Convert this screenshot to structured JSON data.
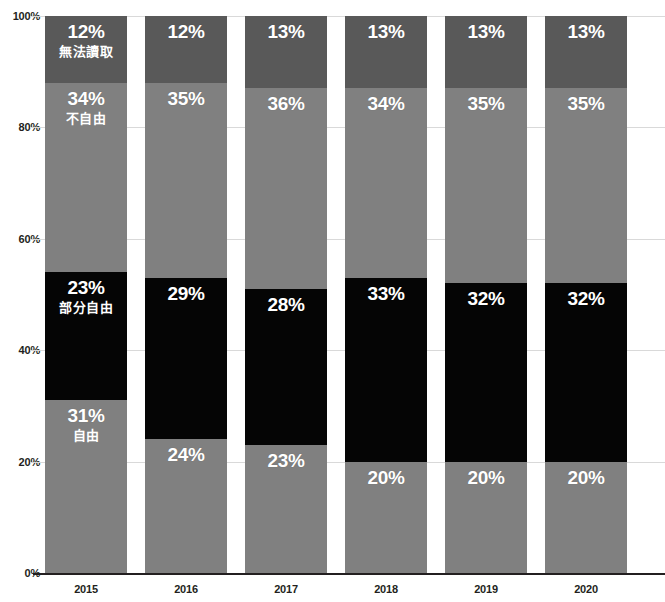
{
  "chart": {
    "title": "",
    "y_axis": {
      "ticks": [
        "0%",
        "20%",
        "40%",
        "60%",
        "80%",
        "100%"
      ],
      "min": 0,
      "max": 100
    },
    "x_axis": {
      "labels": [
        "2015",
        "2016",
        "2017",
        "2018",
        "2019",
        "2020"
      ]
    },
    "series_names": {
      "unrated": "無法讀取",
      "notfree": "不自由",
      "partly": "部分自由",
      "free": "自由"
    },
    "colors": {
      "unrated": "#595959",
      "notfree": "#808080",
      "partly": "#050505",
      "free": "#808080",
      "label_text": "#ffffff",
      "axis_text": "#231f20",
      "gridline": "#d9d9d9",
      "baseline": "#231f20",
      "background": "#ffffff"
    },
    "bars": [
      {
        "year": "2015",
        "unrated": {
          "value": 12,
          "label": "12%",
          "name": "無法讀取",
          "show_name": true
        },
        "notfree": {
          "value": 34,
          "label": "34%",
          "name": "不自由",
          "show_name": true
        },
        "partly": {
          "value": 23,
          "label": "23%",
          "name": "部分自由",
          "show_name": true
        },
        "free": {
          "value": 31,
          "label": "31%",
          "name": "自由",
          "show_name": true
        }
      },
      {
        "year": "2016",
        "unrated": {
          "value": 12,
          "label": "12%",
          "name": "",
          "show_name": false
        },
        "notfree": {
          "value": 35,
          "label": "35%",
          "name": "",
          "show_name": false
        },
        "partly": {
          "value": 29,
          "label": "29%",
          "name": "",
          "show_name": false
        },
        "free": {
          "value": 24,
          "label": "24%",
          "name": "",
          "show_name": false
        }
      },
      {
        "year": "2017",
        "unrated": {
          "value": 13,
          "label": "13%",
          "name": "",
          "show_name": false
        },
        "notfree": {
          "value": 36,
          "label": "36%",
          "name": "",
          "show_name": false
        },
        "partly": {
          "value": 28,
          "label": "28%",
          "name": "",
          "show_name": false
        },
        "free": {
          "value": 23,
          "label": "23%",
          "name": "",
          "show_name": false
        }
      },
      {
        "year": "2018",
        "unrated": {
          "value": 13,
          "label": "13%",
          "name": "",
          "show_name": false
        },
        "notfree": {
          "value": 34,
          "label": "34%",
          "name": "",
          "show_name": false
        },
        "partly": {
          "value": 33,
          "label": "33%",
          "name": "",
          "show_name": false
        },
        "free": {
          "value": 20,
          "label": "20%",
          "name": "",
          "show_name": false
        }
      },
      {
        "year": "2019",
        "unrated": {
          "value": 13,
          "label": "13%",
          "name": "",
          "show_name": false
        },
        "notfree": {
          "value": 35,
          "label": "35%",
          "name": "",
          "show_name": false
        },
        "partly": {
          "value": 32,
          "label": "32%",
          "name": "",
          "show_name": false
        },
        "free": {
          "value": 20,
          "label": "20%",
          "name": "",
          "show_name": false
        }
      },
      {
        "year": "2020",
        "unrated": {
          "value": 13,
          "label": "13%",
          "name": "",
          "show_name": false
        },
        "notfree": {
          "value": 35,
          "label": "35%",
          "name": "",
          "show_name": false
        },
        "partly": {
          "value": 32,
          "label": "32%",
          "name": "",
          "show_name": false
        },
        "free": {
          "value": 20,
          "label": "20%",
          "name": "",
          "show_name": false
        }
      }
    ]
  },
  "chart_data": {
    "type": "bar",
    "subtype": "stacked-bar-100",
    "title": "",
    "subtitle": "",
    "xlabel": "",
    "ylabel": "",
    "categories": [
      "2015",
      "2016",
      "2017",
      "2018",
      "2019",
      "2020"
    ],
    "ylim": [
      0,
      100
    ],
    "ytick_labels": [
      "0%",
      "20%",
      "40%",
      "60%",
      "80%",
      "100%"
    ],
    "grid": true,
    "legend": "inline-labels-on-first-bar",
    "stack_order_bottom_to_top": [
      "自由",
      "部分自由",
      "不自由",
      "無法讀取"
    ],
    "series": [
      {
        "name": "自由",
        "color": "#808080",
        "values": [
          31,
          24,
          23,
          20,
          20,
          20
        ]
      },
      {
        "name": "部分自由",
        "color": "#050505",
        "values": [
          23,
          29,
          28,
          33,
          32,
          32
        ]
      },
      {
        "name": "不自由",
        "color": "#808080",
        "values": [
          34,
          35,
          36,
          34,
          35,
          35
        ]
      },
      {
        "name": "無法讀取",
        "color": "#595959",
        "values": [
          12,
          12,
          13,
          13,
          13,
          13
        ]
      }
    ],
    "annotations": [
      {
        "bar": "2015",
        "segment": "無法讀取",
        "text": "12%"
      },
      {
        "bar": "2015",
        "segment": "不自由",
        "text": "34%"
      },
      {
        "bar": "2015",
        "segment": "部分自由",
        "text": "23%"
      },
      {
        "bar": "2015",
        "segment": "自由",
        "text": "31%"
      },
      {
        "bar": "2016",
        "segment": "無法讀取",
        "text": "12%"
      },
      {
        "bar": "2016",
        "segment": "不自由",
        "text": "35%"
      },
      {
        "bar": "2016",
        "segment": "部分自由",
        "text": "29%"
      },
      {
        "bar": "2016",
        "segment": "自由",
        "text": "24%"
      },
      {
        "bar": "2017",
        "segment": "無法讀取",
        "text": "13%"
      },
      {
        "bar": "2017",
        "segment": "不自由",
        "text": "36%"
      },
      {
        "bar": "2017",
        "segment": "部分自由",
        "text": "28%"
      },
      {
        "bar": "2017",
        "segment": "自由",
        "text": "23%"
      },
      {
        "bar": "2018",
        "segment": "無法讀取",
        "text": "13%"
      },
      {
        "bar": "2018",
        "segment": "不自由",
        "text": "34%"
      },
      {
        "bar": "2018",
        "segment": "部分自由",
        "text": "33%"
      },
      {
        "bar": "2018",
        "segment": "自由",
        "text": "20%"
      },
      {
        "bar": "2019",
        "segment": "無法讀取",
        "text": "13%"
      },
      {
        "bar": "2019",
        "segment": "不自由",
        "text": "35%"
      },
      {
        "bar": "2019",
        "segment": "部分自由",
        "text": "32%"
      },
      {
        "bar": "2019",
        "segment": "自由",
        "text": "20%"
      },
      {
        "bar": "2020",
        "segment": "無法讀取",
        "text": "13%"
      },
      {
        "bar": "2020",
        "segment": "不自由",
        "text": "35%"
      },
      {
        "bar": "2020",
        "segment": "部分自由",
        "text": "32%"
      },
      {
        "bar": "2020",
        "segment": "自由",
        "text": "20%"
      }
    ]
  }
}
